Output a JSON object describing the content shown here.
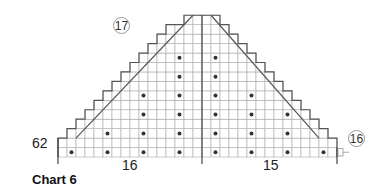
{
  "title": "Chart 6",
  "labels": {
    "row_start": "62",
    "left_count": "16",
    "right_count": "15",
    "top_circle": "17",
    "right_circle": "16"
  },
  "grid": {
    "cell_w": 9,
    "cell_h": 9.45,
    "cols": 31,
    "rows": 15,
    "left": 58,
    "bottom": 157,
    "divider_col": 16,
    "line_color": "#aaaaaa",
    "outline_color": "#555555",
    "dot_color": "#333333"
  },
  "dots": [
    {
      "col": 1,
      "row": 1
    },
    {
      "col": 5,
      "row": 1
    },
    {
      "col": 5,
      "row": 3
    },
    {
      "col": 9,
      "row": 1
    },
    {
      "col": 9,
      "row": 3
    },
    {
      "col": 9,
      "row": 5
    },
    {
      "col": 9,
      "row": 7
    },
    {
      "col": 13,
      "row": 1
    },
    {
      "col": 13,
      "row": 3
    },
    {
      "col": 13,
      "row": 5
    },
    {
      "col": 13,
      "row": 7
    },
    {
      "col": 13,
      "row": 9
    },
    {
      "col": 13,
      "row": 11
    },
    {
      "col": 17,
      "row": 1
    },
    {
      "col": 17,
      "row": 3
    },
    {
      "col": 17,
      "row": 5
    },
    {
      "col": 17,
      "row": 7
    },
    {
      "col": 17,
      "row": 9
    },
    {
      "col": 17,
      "row": 11
    },
    {
      "col": 21,
      "row": 1
    },
    {
      "col": 21,
      "row": 3
    },
    {
      "col": 21,
      "row": 5
    },
    {
      "col": 21,
      "row": 7
    },
    {
      "col": 25,
      "row": 1
    },
    {
      "col": 25,
      "row": 3
    },
    {
      "col": 25,
      "row": 5
    },
    {
      "col": 29,
      "row": 1
    }
  ]
}
